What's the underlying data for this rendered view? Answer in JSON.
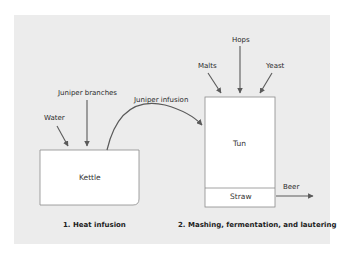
{
  "diagram": {
    "stage1": {
      "caption": "1. Heat infusion",
      "vessel": "Kettle",
      "inputs": [
        "Water",
        "Juniper branches"
      ]
    },
    "transfer": {
      "label": "Juniper infusion"
    },
    "stage2": {
      "caption": "2. Mashing, fermentation, and lautering",
      "vessel": "Tun",
      "filter": "Straw",
      "inputs": [
        "Malts",
        "Hops",
        "Yeast"
      ],
      "output": "Beer"
    },
    "colors": {
      "panel": "#ececec",
      "box_fill": "#ffffff",
      "box_stroke": "#8a8a8a",
      "arrow": "#5a5a5a"
    }
  }
}
